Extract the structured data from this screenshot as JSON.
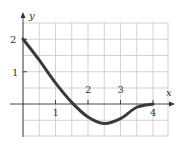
{
  "chart_data": {
    "type": "line",
    "title": "",
    "xlabel": "x",
    "ylabel": "y",
    "xlim": [
      0,
      4.5
    ],
    "ylim": [
      -1,
      2.5
    ],
    "grid": true,
    "grid_step": 0.5,
    "x_ticks": [
      "1",
      "2",
      "3",
      "4"
    ],
    "y_ticks": [
      "1",
      "2"
    ],
    "series": [
      {
        "name": "f(x)",
        "x": [
          0,
          0.5,
          1,
          1.5,
          2,
          2.5,
          3,
          3.5,
          4
        ],
        "y": [
          2,
          1.35,
          0.65,
          0.05,
          -0.4,
          -0.6,
          -0.45,
          -0.1,
          0
        ]
      }
    ],
    "color": "#3a3a3a"
  },
  "labels": {
    "x_axis": "x",
    "y_axis": "y",
    "tick_x1": "1",
    "tick_x2": "2",
    "tick_x3": "3",
    "tick_x4": "4",
    "tick_y1": "1",
    "tick_y2": "2"
  }
}
